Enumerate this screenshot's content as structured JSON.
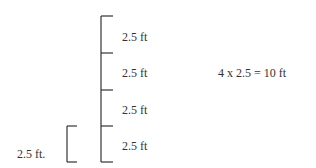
{
  "diagram": {
    "segments": [
      {
        "label": "2.5 ft"
      },
      {
        "label": "2.5 ft"
      },
      {
        "label": "2.5 ft"
      },
      {
        "label": "2.5 ft"
      }
    ],
    "reference_label": "2.5 ft.",
    "equation": "4 x 2.5 = 10 ft",
    "line_color": "#333333"
  }
}
